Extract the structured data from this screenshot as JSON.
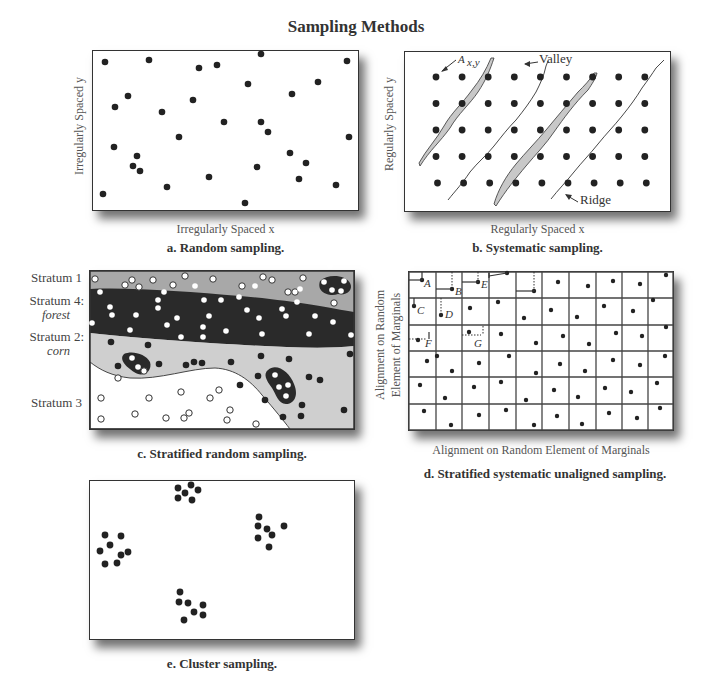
{
  "title": "Sampling Methods",
  "panels": {
    "a": {
      "caption": "a. Random sampling.",
      "x_label": "Irregularly Spaced x",
      "y_label": "Irregularly Spaced y",
      "points": [
        [
          105,
          62
        ],
        [
          149,
          60
        ],
        [
          199,
          68
        ],
        [
          217,
          65
        ],
        [
          261,
          54
        ],
        [
          347,
          61
        ],
        [
          128,
          96
        ],
        [
          115,
          107
        ],
        [
          162,
          112
        ],
        [
          193,
          100
        ],
        [
          248,
          84
        ],
        [
          292,
          94
        ],
        [
          318,
          82
        ],
        [
          224,
          122
        ],
        [
          261,
          122
        ],
        [
          268,
          132
        ],
        [
          179,
          137
        ],
        [
          114,
          147
        ],
        [
          137,
          156
        ],
        [
          133,
          166
        ],
        [
          140,
          171
        ],
        [
          209,
          177
        ],
        [
          257,
          167
        ],
        [
          290,
          153
        ],
        [
          306,
          163
        ],
        [
          299,
          179
        ],
        [
          336,
          185
        ],
        [
          167,
          187
        ],
        [
          103,
          194
        ],
        [
          245,
          203
        ],
        [
          349,
          137
        ]
      ]
    },
    "b": {
      "caption": "b. Systematic sampling.",
      "x_label": "Regularly Spaced x",
      "y_label": "Regularly Spaced y",
      "grid": {
        "cols": 9,
        "rows": 5,
        "x0": 436,
        "dx": 26.1,
        "y0": 77,
        "dy": 26.5
      },
      "annotations": {
        "point_label": "A",
        "point_sub": "x,y",
        "valley": "Valley",
        "ridge": "Ridge"
      }
    },
    "c": {
      "caption": "c. Stratified random sampling.",
      "strata": [
        {
          "name": "Stratum 1",
          "sub": ""
        },
        {
          "name": "Stratum 4:",
          "sub": "forest"
        },
        {
          "name": "Stratum 2:",
          "sub": "corn"
        },
        {
          "name": "Stratum 3",
          "sub": ""
        }
      ],
      "colors": {
        "stratum1": "#a8a8a8",
        "stratum4": "#2a2a2a",
        "stratum2": "#cfcfcf",
        "stratum3": "#ffffff"
      }
    },
    "d": {
      "caption": "d. Stratified systematic unaligned sampling.",
      "x_label": "Alignment on Random Element of Marginals",
      "y_label_line1": "Alignment on Random",
      "y_label_line2": "Element of Marginals",
      "grid": {
        "cols": 10,
        "rows": 6
      },
      "labels": [
        "A",
        "B",
        "C",
        "D",
        "E",
        "F",
        "G"
      ]
    },
    "e": {
      "caption": "e. Cluster sampling.",
      "clusters": [
        [
          [
            178,
            488
          ],
          [
            191,
            485
          ],
          [
            198,
            490
          ],
          [
            185,
            493
          ],
          [
            178,
            498
          ],
          [
            192,
            500
          ]
        ],
        [
          [
            105,
            535
          ],
          [
            110,
            545
          ],
          [
            100,
            551
          ],
          [
            121,
            536
          ],
          [
            121,
            555
          ],
          [
            128,
            552
          ],
          [
            105,
            564
          ],
          [
            117,
            563
          ]
        ],
        [
          [
            259,
            517
          ],
          [
            258,
            526
          ],
          [
            267,
            529
          ],
          [
            272,
            535
          ],
          [
            258,
            538
          ],
          [
            269,
            547
          ],
          [
            284,
            526
          ]
        ],
        [
          [
            180,
            592
          ],
          [
            179,
            602
          ],
          [
            188,
            603
          ],
          [
            194,
            612
          ],
          [
            203,
            605
          ],
          [
            203,
            615
          ],
          [
            184,
            620
          ]
        ]
      ]
    }
  },
  "colors": {
    "dot": "#222222",
    "frame": "#333333",
    "valley_fill": "#c8c8c8"
  }
}
